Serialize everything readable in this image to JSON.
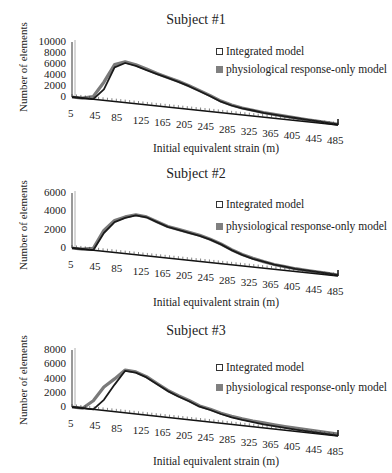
{
  "colors": {
    "integrated": "#1a1a1a",
    "physio": "#7a7a7a",
    "axis": "#111111"
  },
  "legend": {
    "integrated": "Integrated model",
    "physio": "physiological response-only model"
  },
  "axis_labels": {
    "y": "Number of elements",
    "x": "Initial equivalent strain  (m)"
  },
  "chart_data": [
    {
      "type": "area",
      "title": "Subject #1",
      "xlabel": "Initial equivalent strain  (m)",
      "ylabel": "Number of elements",
      "ylim": [
        0,
        10000
      ],
      "yticks": [
        "10000",
        "8000",
        "6000",
        "4000",
        "2000",
        "0"
      ],
      "categories": [
        "5",
        "45",
        "85",
        "125",
        "165",
        "205",
        "245",
        "285",
        "325",
        "365",
        "405",
        "445",
        "485"
      ],
      "x": [
        5,
        25,
        45,
        65,
        85,
        105,
        125,
        145,
        165,
        185,
        205,
        225,
        245,
        265,
        285,
        305,
        325,
        345,
        365,
        385,
        405,
        425,
        445,
        465,
        485,
        505
      ],
      "series": [
        {
          "name": "Integrated model",
          "values": [
            0,
            0,
            0,
            2000,
            6200,
            7200,
            6900,
            6300,
            5800,
            5300,
            4800,
            4200,
            3500,
            2800,
            2000,
            1500,
            1200,
            1000,
            800,
            650,
            550,
            450,
            350,
            280,
            200,
            100
          ]
        },
        {
          "name": "physiological response-only model",
          "values": [
            0,
            0,
            500,
            3300,
            6700,
            7400,
            7100,
            6500,
            5900,
            5400,
            4900,
            4300,
            3600,
            2900,
            2100,
            1600,
            1250,
            1050,
            850,
            700,
            580,
            470,
            370,
            290,
            210,
            110
          ]
        }
      ],
      "legend_position": "upper right",
      "grid": false
    },
    {
      "type": "area",
      "title": "Subject #2",
      "xlabel": "Initial equivalent strain  (m)",
      "ylabel": "Number of elements",
      "ylim": [
        0,
        6000
      ],
      "yticks": [
        "6000",
        "4000",
        "2000",
        "0"
      ],
      "categories": [
        "5",
        "45",
        "85",
        "125",
        "165",
        "205",
        "245",
        "285",
        "325",
        "365",
        "405",
        "445",
        "485"
      ],
      "x": [
        5,
        25,
        45,
        65,
        85,
        105,
        125,
        145,
        165,
        185,
        205,
        225,
        245,
        265,
        285,
        305,
        325,
        345,
        365,
        385,
        405,
        425,
        445,
        465,
        485,
        505
      ],
      "series": [
        {
          "name": "Integrated model",
          "values": [
            0,
            0,
            0,
            2000,
            3300,
            3900,
            4300,
            4200,
            3800,
            3400,
            3200,
            3000,
            2800,
            2500,
            2100,
            1600,
            1200,
            900,
            700,
            500,
            400,
            300,
            250,
            200,
            150,
            100
          ]
        },
        {
          "name": "physiological response-only model",
          "values": [
            0,
            0,
            200,
            2300,
            3500,
            4000,
            4350,
            4250,
            3850,
            3450,
            3250,
            3050,
            2850,
            2550,
            2150,
            1650,
            1250,
            950,
            720,
            520,
            410,
            310,
            260,
            210,
            160,
            110
          ]
        }
      ],
      "legend_position": "upper right",
      "grid": false
    },
    {
      "type": "area",
      "title": "Subject #3",
      "xlabel": "Initial equivalent strain  (m)",
      "ylabel": "Number of elements",
      "ylim": [
        0,
        8000
      ],
      "yticks": [
        "8000",
        "6000",
        "4000",
        "2000",
        "0"
      ],
      "categories": [
        "5",
        "45",
        "85",
        "125",
        "165",
        "205",
        "245",
        "285",
        "325",
        "365",
        "405",
        "445",
        "485"
      ],
      "x": [
        5,
        25,
        45,
        65,
        85,
        105,
        125,
        145,
        165,
        185,
        205,
        225,
        245,
        265,
        285,
        305,
        325,
        345,
        365,
        385,
        405,
        425,
        445,
        465,
        485,
        505
      ],
      "series": [
        {
          "name": "Integrated model",
          "values": [
            0,
            0,
            0,
            1500,
            3800,
            5900,
            5800,
            5300,
            4500,
            3700,
            3100,
            2600,
            2000,
            1700,
            1300,
            1000,
            800,
            650,
            500,
            400,
            320,
            250,
            200,
            150,
            100,
            60
          ]
        },
        {
          "name": "physiological response-only model",
          "values": [
            0,
            0,
            1200,
            3300,
            4600,
            6000,
            5900,
            5400,
            4600,
            3800,
            3200,
            2700,
            2100,
            1800,
            1400,
            1150,
            950,
            800,
            700,
            600,
            520,
            450,
            400,
            350,
            300,
            250
          ]
        }
      ],
      "legend_position": "upper right",
      "grid": false
    }
  ]
}
